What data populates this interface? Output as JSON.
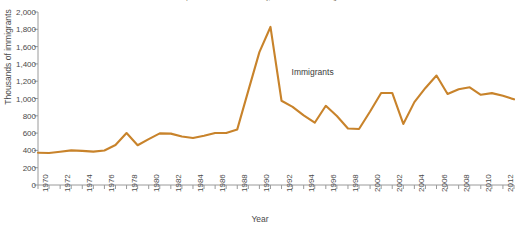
{
  "figure": {
    "source_note": "Source: U.S. Department of Homeland Security, 2013 Yearbook of Immigration Statistics",
    "annotation_label": "Immigrants"
  },
  "chart_data": {
    "type": "line",
    "title": "",
    "subtitle": "",
    "xlabel": "Year",
    "ylabel": "Thousands of immigrants",
    "xlim": [
      1970,
      2013
    ],
    "ylim": [
      0,
      2000
    ],
    "grid": false,
    "legend_position": "inline-annotation",
    "line_color": "#C8832B",
    "axis_color": "#9a9a9a",
    "text_color": "#4a4a4a",
    "y_ticks": [
      0,
      200,
      400,
      600,
      800,
      1000,
      1200,
      1400,
      1600,
      1800,
      2000
    ],
    "y_tick_labels": [
      "0",
      "200",
      "400",
      "600",
      "800",
      "1,000",
      "1,200",
      "1,400",
      "1,600",
      "1,800",
      "2,000"
    ],
    "x_ticks": [
      1970,
      1971,
      1972,
      1973,
      1974,
      1975,
      1976,
      1977,
      1978,
      1979,
      1980,
      1981,
      1982,
      1983,
      1984,
      1985,
      1986,
      1987,
      1988,
      1989,
      1990,
      1991,
      1992,
      1993,
      1994,
      1995,
      1996,
      1997,
      1998,
      1999,
      2000,
      2001,
      2002,
      2003,
      2004,
      2005,
      2006,
      2007,
      2008,
      2009,
      2010,
      2011,
      2012,
      2013
    ],
    "x_tick_labels": [
      "1970",
      "1972",
      "1974",
      "1976",
      "1978",
      "1980",
      "1982",
      "1984",
      "1986",
      "1988",
      "1990",
      "1992",
      "1994",
      "1996",
      "1998",
      "2000",
      "2002",
      "2004",
      "2006",
      "2008",
      "2010",
      "2012"
    ],
    "x_tick_label_years": [
      1970,
      1972,
      1974,
      1976,
      1978,
      1980,
      1982,
      1984,
      1986,
      1988,
      1990,
      1992,
      1994,
      1996,
      1998,
      2000,
      2002,
      2004,
      2006,
      2008,
      2010,
      2012
    ],
    "series": [
      {
        "name": "Immigrants",
        "x": [
          1970,
          1971,
          1972,
          1973,
          1974,
          1975,
          1976,
          1977,
          1978,
          1979,
          1980,
          1981,
          1982,
          1983,
          1984,
          1985,
          1986,
          1987,
          1988,
          1989,
          1990,
          1991,
          1992,
          1993,
          1994,
          1995,
          1996,
          1997,
          1998,
          1999,
          2000,
          2001,
          2002,
          2003,
          2004,
          2005,
          2006,
          2007,
          2008,
          2009,
          2010,
          2011,
          2012,
          2013
        ],
        "values": [
          373,
          370,
          385,
          400,
          395,
          386,
          399,
          462,
          601,
          460,
          531,
          597,
          594,
          560,
          544,
          570,
          602,
          602,
          643,
          1091,
          1536,
          1827,
          974,
          904,
          804,
          720,
          916,
          798,
          654,
          647,
          850,
          1064,
          1064,
          706,
          958,
          1122,
          1266,
          1052,
          1107,
          1130,
          1043,
          1062,
          1031,
          990
        ]
      }
    ]
  }
}
